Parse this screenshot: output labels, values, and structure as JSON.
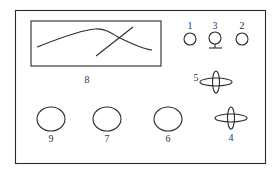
{
  "diagram": {
    "title": "",
    "colors": {
      "line": "#2a2a2a",
      "label": "#333333",
      "background": "#ffffff"
    },
    "panel": {
      "name": "instrument-front-panel"
    },
    "components": [
      {
        "id": "display",
        "label": "8",
        "shape": "rectangle-with-curves"
      },
      {
        "id": "indicator-1",
        "label": "1",
        "shape": "small-circle"
      },
      {
        "id": "terminal-3",
        "label": "3",
        "shape": "circle-with-ground-stand"
      },
      {
        "id": "indicator-2",
        "label": "2",
        "shape": "small-circle"
      },
      {
        "id": "knob-5",
        "label": "5",
        "shape": "crossed-ellipses"
      },
      {
        "id": "knob-4",
        "label": "4",
        "shape": "crossed-ellipses"
      },
      {
        "id": "dial-9",
        "label": "9",
        "shape": "ellipse"
      },
      {
        "id": "dial-7",
        "label": "7",
        "shape": "ellipse"
      },
      {
        "id": "dial-6",
        "label": "6",
        "shape": "ellipse"
      }
    ]
  }
}
